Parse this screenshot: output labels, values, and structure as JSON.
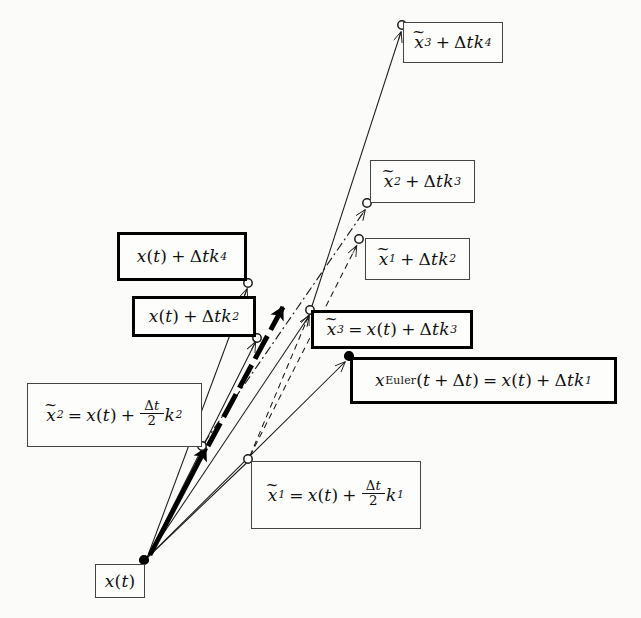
{
  "figure": {
    "background_color": "#fbfbfa",
    "ink_color": "#1a1a1a",
    "width": 641,
    "height": 618
  },
  "labels": {
    "origin": {
      "id": "x-of-t",
      "text": "x(t)",
      "border": "thin",
      "x": 95,
      "y": 564,
      "w": 50,
      "h": 34
    },
    "x1_tilde": {
      "id": "x1-tilde-def",
      "text": "x̃₁ = x(t) + (Δt/2) k₁",
      "border": "thin",
      "x": 251,
      "y": 461,
      "w": 170,
      "h": 68
    },
    "x2_tilde": {
      "id": "x2-tilde-def",
      "text": "x̃₂ = x(t) + (Δt/2) k₂",
      "border": "thin",
      "x": 27,
      "y": 383,
      "w": 175,
      "h": 64
    },
    "euler": {
      "id": "euler-step",
      "text": "xEuler(t + Δt) = x(t) + Δt k₁",
      "border": "thick",
      "x": 350,
      "y": 357,
      "w": 267,
      "h": 47
    },
    "x3_tilde": {
      "id": "x3-tilde-def",
      "text": "x̃₃ = x(t) + Δt k₃",
      "border": "thick",
      "x": 311,
      "y": 310,
      "w": 162,
      "h": 39
    },
    "xt_k2": {
      "id": "xt-plus-dtk2",
      "text": "x(t) + Δt k₂",
      "border": "thick",
      "x": 132,
      "y": 296,
      "w": 124,
      "h": 41
    },
    "xt_k4": {
      "id": "xt-plus-dtk4",
      "text": "x(t) + Δt k₄",
      "border": "thick",
      "x": 117,
      "y": 232,
      "w": 130,
      "h": 49
    },
    "x1_k2": {
      "id": "x1-tilde-plus-dtk2",
      "text": "x̃₁ + Δt k₂",
      "border": "thin",
      "x": 365,
      "y": 238,
      "w": 105,
      "h": 42
    },
    "x2_k3": {
      "id": "x2-tilde-plus-dtk3",
      "text": "x̃₂ + Δt k₃",
      "border": "thin",
      "x": 370,
      "y": 160,
      "w": 105,
      "h": 43
    },
    "x3_k4": {
      "id": "x3-tilde-plus-dtk4",
      "text": "x̃₃ + Δt k₄",
      "border": "thin",
      "x": 403,
      "y": 22,
      "w": 100,
      "h": 41
    }
  },
  "nodes": [
    {
      "name": "origin-point",
      "kind": "filled",
      "x": 144,
      "y": 560
    },
    {
      "name": "x1-tilde-point",
      "kind": "open",
      "x": 248,
      "y": 459
    },
    {
      "name": "x2-tilde-point",
      "kind": "open",
      "x": 202,
      "y": 446
    },
    {
      "name": "euler-point",
      "kind": "filled",
      "x": 349,
      "y": 356
    },
    {
      "name": "x3-tilde-point",
      "kind": "open",
      "x": 310,
      "y": 310
    },
    {
      "name": "xt-plus-dtk2-point",
      "kind": "open",
      "x": 257,
      "y": 337
    },
    {
      "name": "xt-plus-dtk4-point",
      "kind": "open",
      "x": 248,
      "y": 283
    },
    {
      "name": "x1-plus-dtk2-point",
      "kind": "open",
      "x": 359,
      "y": 239
    },
    {
      "name": "x2-plus-dtk3-point",
      "kind": "open",
      "x": 367,
      "y": 203
    },
    {
      "name": "x3-plus-dtk4-point",
      "kind": "open",
      "x": 402,
      "y": 25
    }
  ],
  "edges": [
    {
      "name": "k1-euler-ray",
      "style": "solid",
      "from": [
        146,
        559
      ],
      "to": [
        348,
        359
      ]
    },
    {
      "name": "k1-half-ray",
      "style": "solid",
      "from": [
        146,
        559
      ],
      "to": [
        247,
        461
      ]
    },
    {
      "name": "k2-half-ray",
      "style": "solid",
      "from": [
        146,
        559
      ],
      "to": [
        203,
        448
      ]
    },
    {
      "name": "k4-full-ray",
      "style": "solid",
      "from": [
        146,
        559
      ],
      "to": [
        248,
        286
      ]
    },
    {
      "name": "k2-full-ray",
      "style": "solid",
      "from": [
        146,
        559
      ],
      "to": [
        256,
        340
      ]
    },
    {
      "name": "k3-full-ray",
      "style": "solid",
      "from": [
        146,
        559
      ],
      "to": [
        310,
        313
      ]
    },
    {
      "name": "x1-to-k2-dashed",
      "style": "dashed",
      "from": [
        249,
        457
      ],
      "to": [
        358,
        243
      ]
    },
    {
      "name": "x2-to-k3-dashdot",
      "style": "dashdot",
      "from": [
        203,
        444
      ],
      "to": [
        366,
        207
      ]
    },
    {
      "name": "x3-to-k4-solid",
      "style": "solid",
      "from": [
        311,
        308
      ],
      "to": [
        402,
        29
      ]
    },
    {
      "name": "rk4-result-bold",
      "style": "bold",
      "from": [
        148,
        557
      ],
      "to": [
        286,
        303
      ]
    }
  ],
  "colors": {
    "paper": "#fbfbfa",
    "ink": "#1a1a1a",
    "bold_ink": "#000000"
  }
}
